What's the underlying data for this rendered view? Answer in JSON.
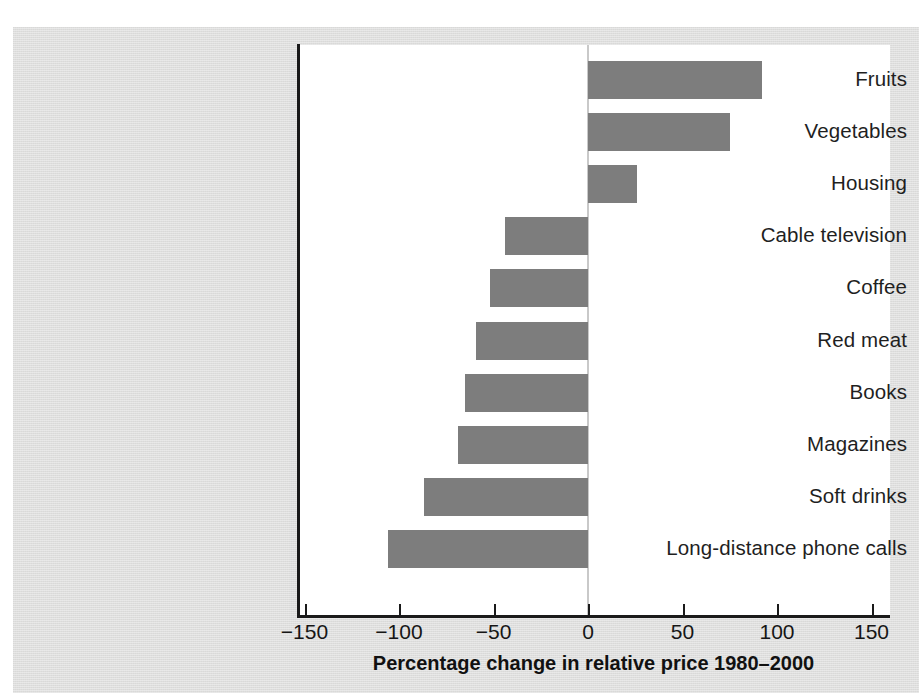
{
  "chart_data": {
    "type": "bar",
    "orientation": "horizontal",
    "title": "",
    "xlabel": "Percentage change in relative price 1980–2000",
    "ylabel": "",
    "xlim": [
      -150,
      150
    ],
    "xticks": [
      -150,
      -100,
      -50,
      0,
      50,
      100,
      150
    ],
    "xtick_labels": [
      "−150",
      "−100",
      "−50",
      "0",
      "50",
      "100",
      "150"
    ],
    "grid": false,
    "legend": null,
    "zero_reference_line": true,
    "categories": [
      "Fruits",
      "Vegetables",
      "Housing",
      "Cable television",
      "Coffee",
      "Red meat",
      "Books",
      "Magazines",
      "Soft drinks",
      "Long-distance phone calls"
    ],
    "values": [
      92,
      75,
      26,
      -44,
      -52,
      -59,
      -65,
      -69,
      -87,
      -106
    ],
    "bar_color": "#7d7d7d",
    "plot_background": "#ffffff",
    "figure_background": "#dededd",
    "axis_color": "#1a1a1a"
  },
  "axis": {
    "title": "Percentage change in relative price 1980–2000"
  }
}
